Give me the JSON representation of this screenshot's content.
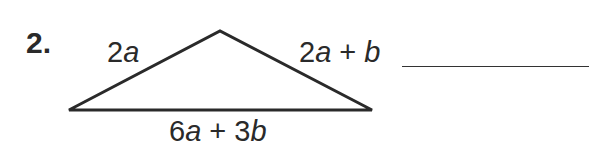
{
  "problem": {
    "number": "2.",
    "side_left": {
      "coef": "2",
      "var": "a",
      "rest": ""
    },
    "side_right": {
      "coef": "2",
      "var": "a",
      "op": " + ",
      "var2": "b"
    },
    "side_bottom": {
      "coef": "6",
      "var": "a",
      "op": " + 3",
      "var2": "b"
    },
    "answer_blank": ""
  },
  "triangle": {
    "points": "69,110 220,31 372,110",
    "stroke": "#2a2a2a"
  }
}
